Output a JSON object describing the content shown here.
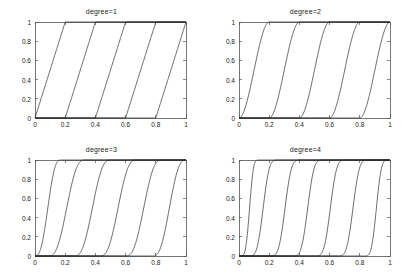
{
  "figure": {
    "background": "#ffffff",
    "line_color": "#2b2b2b",
    "axis_color": "#555555",
    "layout": "2x2 subplot grid"
  },
  "chart_data": [
    {
      "type": "line",
      "title": "degree=1",
      "xlabel": "",
      "ylabel": "",
      "xlim": [
        0,
        1
      ],
      "ylim": [
        0,
        1
      ],
      "grid": false,
      "legend": null,
      "xticks": [
        0,
        0.2,
        0.4,
        0.6,
        0.8,
        1
      ],
      "xtick_labels": [
        "0",
        "0.2",
        "0.4",
        "0.6",
        "0.8",
        "1"
      ],
      "yticks": [
        0,
        0.2,
        0.4,
        0.6,
        0.8,
        1
      ],
      "ytick_labels": [
        "0",
        "0.2",
        "0.4",
        "0.6",
        "0.8",
        "1"
      ],
      "degree": 1,
      "n_curves": 5,
      "description": "Five linear ramps, each rising from 0 to 1 over a width-0.2 interval",
      "knot_starts": [
        0,
        0.2,
        0.4,
        0.6,
        0.8
      ],
      "series": [
        {
          "name": "basis-1",
          "start": 0.0,
          "end": 0.2
        },
        {
          "name": "basis-2",
          "start": 0.2,
          "end": 0.4
        },
        {
          "name": "basis-3",
          "start": 0.4,
          "end": 0.6
        },
        {
          "name": "basis-4",
          "start": 0.6,
          "end": 0.8
        },
        {
          "name": "basis-5",
          "start": 0.8,
          "end": 1.0
        }
      ]
    },
    {
      "type": "line",
      "title": "degree=2",
      "xlabel": "",
      "ylabel": "",
      "xlim": [
        0,
        1
      ],
      "ylim": [
        0,
        1
      ],
      "grid": false,
      "legend": null,
      "xticks": [
        0,
        0.2,
        0.4,
        0.6,
        0.8,
        1
      ],
      "xtick_labels": [
        "0",
        "0.2",
        "0.4",
        "0.6",
        "0.8",
        "1"
      ],
      "yticks": [
        0,
        0.2,
        0.4,
        0.6,
        0.8,
        1
      ],
      "ytick_labels": [
        "0",
        "0.2",
        "0.4",
        "0.6",
        "0.8",
        "1"
      ],
      "degree": 2,
      "n_curves": 5,
      "description": "Five smooth sigmoid (S-shaped) cumulative curves, each rising 0 to 1 over a width-0.2 interval",
      "knot_starts": [
        0,
        0.2,
        0.4,
        0.6,
        0.8
      ],
      "series": [
        {
          "name": "basis-1",
          "start": 0.0,
          "end": 0.2
        },
        {
          "name": "basis-2",
          "start": 0.2,
          "end": 0.4
        },
        {
          "name": "basis-3",
          "start": 0.4,
          "end": 0.6
        },
        {
          "name": "basis-4",
          "start": 0.6,
          "end": 0.8
        },
        {
          "name": "basis-5",
          "start": 0.8,
          "end": 1.0
        }
      ]
    },
    {
      "type": "line",
      "title": "degree=3",
      "xlabel": "",
      "ylabel": "",
      "xlim": [
        0,
        1
      ],
      "ylim": [
        0,
        1
      ],
      "grid": false,
      "legend": null,
      "xticks": [
        0,
        0.2,
        0.4,
        0.6,
        0.8,
        1
      ],
      "xtick_labels": [
        "0",
        "0.2",
        "0.4",
        "0.6",
        "0.8",
        "1"
      ],
      "yticks": [
        0,
        0.2,
        0.4,
        0.6,
        0.8,
        1
      ],
      "ytick_labels": [
        "0",
        "0.2",
        "0.4",
        "0.6",
        "0.8",
        "1"
      ],
      "degree": 3,
      "n_curves": 6,
      "description": "Six smooth sigmoid cumulative curves spread across the unit interval",
      "knot_starts": [
        0,
        0.15,
        0.32,
        0.49,
        0.66,
        0.83
      ],
      "series": [
        {
          "name": "basis-1",
          "start": 0.0,
          "end": 0.17
        },
        {
          "name": "basis-2",
          "start": 0.09,
          "end": 0.33
        },
        {
          "name": "basis-3",
          "start": 0.26,
          "end": 0.5
        },
        {
          "name": "basis-4",
          "start": 0.43,
          "end": 0.67
        },
        {
          "name": "basis-5",
          "start": 0.6,
          "end": 0.84
        },
        {
          "name": "basis-6",
          "start": 0.78,
          "end": 1.0
        }
      ]
    },
    {
      "type": "line",
      "title": "degree=4",
      "xlabel": "",
      "ylabel": "",
      "xlim": [
        0,
        1
      ],
      "ylim": [
        0,
        1
      ],
      "grid": false,
      "legend": null,
      "xticks": [
        0,
        0.2,
        0.4,
        0.6,
        0.8,
        1
      ],
      "xtick_labels": [
        "0",
        "0.2",
        "0.4",
        "0.6",
        "0.8",
        "1"
      ],
      "yticks": [
        0,
        0.2,
        0.4,
        0.6,
        0.8,
        1
      ],
      "ytick_labels": [
        "0",
        "0.2",
        "0.4",
        "0.6",
        "0.8",
        "1"
      ],
      "degree": 4,
      "n_curves": 7,
      "description": "Seven smooth sigmoid cumulative curves spread across the unit interval",
      "knot_starts": [
        0,
        0.12,
        0.27,
        0.42,
        0.57,
        0.72,
        0.86
      ],
      "series": [
        {
          "name": "basis-1",
          "start": 0.0,
          "end": 0.14
        },
        {
          "name": "basis-2",
          "start": 0.05,
          "end": 0.27
        },
        {
          "name": "basis-3",
          "start": 0.19,
          "end": 0.42
        },
        {
          "name": "basis-4",
          "start": 0.34,
          "end": 0.57
        },
        {
          "name": "basis-5",
          "start": 0.49,
          "end": 0.72
        },
        {
          "name": "basis-6",
          "start": 0.64,
          "end": 0.87
        },
        {
          "name": "basis-7",
          "start": 0.82,
          "end": 1.0
        }
      ]
    }
  ]
}
